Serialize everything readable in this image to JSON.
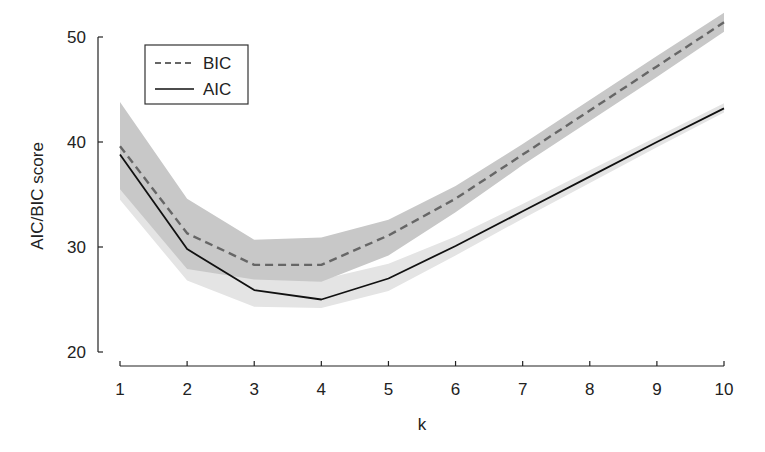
{
  "chart_data": {
    "type": "line",
    "title": "",
    "xlabel": "k",
    "ylabel": "AIC/BIC score",
    "x": [
      1,
      2,
      3,
      4,
      5,
      6,
      7,
      8,
      9,
      10
    ],
    "xticks": [
      "1",
      "2",
      "3",
      "4",
      "5",
      "6",
      "7",
      "8",
      "9",
      "10"
    ],
    "yticks": [
      "20",
      "30",
      "40",
      "50"
    ],
    "xlim": [
      1,
      10
    ],
    "ylim": [
      20,
      50
    ],
    "grid": false,
    "legend_position": "upper left",
    "series": [
      {
        "name": "BIC",
        "style": "dashed",
        "color": "#666666",
        "values": [
          39.6,
          31.3,
          28.3,
          28.3,
          31.1,
          34.6,
          38.8,
          43.0,
          47.2,
          51.4
        ],
        "band_upper": [
          43.8,
          34.6,
          30.7,
          30.9,
          32.6,
          35.8,
          39.8,
          44.0,
          48.2,
          52.3
        ],
        "band_lower": [
          35.5,
          27.9,
          26.9,
          26.7,
          29.2,
          33.3,
          37.8,
          42.0,
          46.2,
          50.5
        ],
        "band_color": "#c8c8c8"
      },
      {
        "name": "AIC",
        "style": "solid",
        "color": "#111111",
        "values": [
          38.8,
          29.8,
          25.9,
          25.0,
          27.0,
          30.1,
          33.4,
          36.7,
          40.0,
          43.2
        ],
        "band_upper": [
          40.5,
          31.3,
          27.2,
          26.9,
          28.4,
          31.0,
          34.1,
          37.3,
          40.5,
          43.7
        ],
        "band_lower": [
          34.5,
          26.8,
          24.3,
          24.2,
          25.8,
          29.2,
          32.7,
          36.1,
          39.5,
          42.8
        ],
        "band_color": "#e4e4e4"
      }
    ]
  }
}
